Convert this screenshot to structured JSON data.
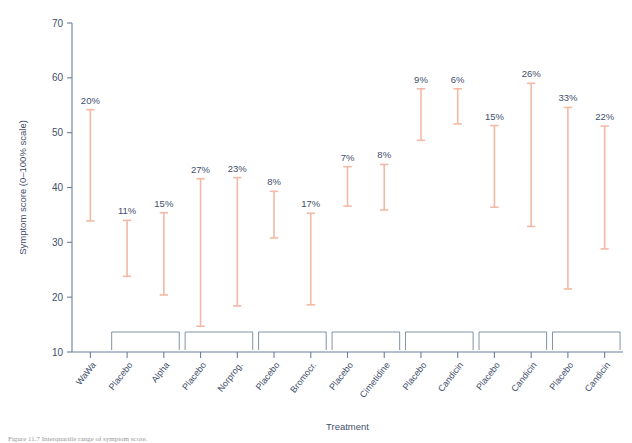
{
  "figure": {
    "caption": "Figure 11.7 Interquartile range of symptom score.",
    "axis_color": "#6b7f99",
    "bar_color": "#f3b9a6",
    "label_color": "#3f4f6b"
  },
  "chart_data": {
    "type": "bar",
    "title": "",
    "xlabel": "Treatment",
    "ylabel": "Symptom score (0–100% scale)",
    "ylim": [
      10,
      70
    ],
    "yticks": [
      10,
      20,
      30,
      40,
      50,
      60,
      70
    ],
    "ytick_labels": [
      "10",
      "20",
      "30",
      "40",
      "50",
      "60",
      "70"
    ],
    "grid": false,
    "legend": "none",
    "orientation": "vertical",
    "series_note": "Each vertical line spans the interquartile range (low–high); the text label above each line is the percentage annotation.",
    "categories": [
      "WaWa",
      "Placebo",
      "Alpha",
      "Placebo",
      "Norprog.",
      "Placebo",
      "Bromocr.",
      "Placebo",
      "Cimetidine",
      "Placebo",
      "Candicin",
      "Placebo",
      "Candicin",
      "Placebo",
      "Candicin"
    ],
    "points": [
      {
        "category": "WaWa",
        "low": 33.9,
        "high": 54.2,
        "label": "20%"
      },
      {
        "category": "Placebo",
        "low": 23.8,
        "high": 34.0,
        "label": "11%"
      },
      {
        "category": "Alpha",
        "low": 20.4,
        "high": 35.4,
        "label": "15%"
      },
      {
        "category": "Placebo",
        "low": 14.7,
        "high": 41.6,
        "label": "27%"
      },
      {
        "category": "Norprog.",
        "low": 18.4,
        "high": 41.8,
        "label": "23%"
      },
      {
        "category": "Placebo",
        "low": 30.8,
        "high": 39.3,
        "label": "8%"
      },
      {
        "category": "Bromocr.",
        "low": 18.6,
        "high": 35.3,
        "label": "17%"
      },
      {
        "category": "Placebo",
        "low": 36.6,
        "high": 43.8,
        "label": "7%"
      },
      {
        "category": "Cimetidine",
        "low": 35.9,
        "high": 44.2,
        "label": "8%"
      },
      {
        "category": "Placebo",
        "low": 48.6,
        "high": 58.0,
        "label": "9%"
      },
      {
        "category": "Candicin",
        "low": 51.6,
        "high": 58.0,
        "label": "6%"
      },
      {
        "category": "Placebo",
        "low": 36.4,
        "high": 51.3,
        "label": "15%"
      },
      {
        "category": "Candicin",
        "low": 32.9,
        "high": 59.0,
        "label": "26%"
      },
      {
        "category": "Placebo",
        "low": 21.5,
        "high": 54.6,
        "label": "33%"
      },
      {
        "category": "Candicin",
        "low": 28.8,
        "high": 51.2,
        "label": "22%"
      }
    ],
    "groups": [
      {
        "from": 1,
        "to": 2
      },
      {
        "from": 3,
        "to": 4
      },
      {
        "from": 5,
        "to": 6
      },
      {
        "from": 7,
        "to": 8
      },
      {
        "from": 9,
        "to": 10
      },
      {
        "from": 11,
        "to": 12
      },
      {
        "from": 13,
        "to": 14
      }
    ]
  }
}
